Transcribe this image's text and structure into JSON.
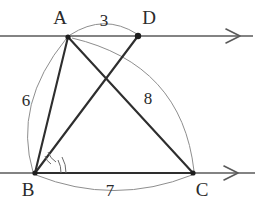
{
  "figure": {
    "background_color": "#ffffff",
    "line_color": "#5a5a5a",
    "segment_color": "#2e2e2e",
    "arc_color": "#8e8e8e",
    "label_color": "#2b2b2b"
  },
  "points": [
    {
      "id": "A",
      "label": "A",
      "x": 68,
      "y": 37,
      "label_x": 60,
      "label_y": 24,
      "dot": true
    },
    {
      "id": "D",
      "label": "D",
      "x": 138,
      "y": 36,
      "label_x": 149,
      "label_y": 24,
      "dot": true
    },
    {
      "id": "B",
      "label": "B",
      "x": 35,
      "y": 173,
      "label_x": 28,
      "label_y": 196,
      "dot": true
    },
    {
      "id": "C",
      "label": "C",
      "x": 193,
      "y": 173,
      "label_x": 202,
      "label_y": 196,
      "dot": true
    }
  ],
  "measure_labels": [
    {
      "id": "len-AD",
      "value": "3",
      "x": 104,
      "y": 26,
      "between": "A-D"
    },
    {
      "id": "len-AB",
      "value": "6",
      "x": 26,
      "y": 106,
      "between": "A-B"
    },
    {
      "id": "len-AC",
      "value": "8",
      "x": 148,
      "y": 104,
      "between": "A-C"
    },
    {
      "id": "len-BC",
      "value": "7",
      "x": 110,
      "y": 196,
      "between": "B-C"
    }
  ],
  "rays": [
    {
      "id": "ray-top",
      "x1": 0,
      "y1": 36,
      "x2": 253,
      "y2": 36,
      "arrow_at": 234
    },
    {
      "id": "ray-bottom",
      "x1": 0,
      "y1": 173,
      "x2": 255,
      "y2": 173,
      "arrow_at": 233
    }
  ],
  "segments": [
    {
      "id": "seg-AB",
      "from": "A",
      "to": "B"
    },
    {
      "id": "seg-AC",
      "from": "A",
      "to": "C"
    },
    {
      "id": "seg-BD",
      "from": "B",
      "to": "D"
    },
    {
      "id": "seg-BC",
      "from": "B",
      "to": "C"
    }
  ],
  "arcs": [
    {
      "id": "arc-AD",
      "d": "M 70 35 Q 104 13 137 34",
      "label": "3"
    },
    {
      "id": "arc-AB",
      "d": "M 66 39 Q 13 104 33 172",
      "label": "6"
    },
    {
      "id": "arc-AC",
      "d": "M 72 38 Q 182 64 194 171",
      "label": "8"
    },
    {
      "id": "arc-BC",
      "d": "M 36 175 Q 114 206 192 175",
      "label": "7"
    }
  ],
  "angle_marks": [
    {
      "id": "angle-ABD-inner",
      "d": "M 45 156 A 14 14 0 0 0 51 164"
    },
    {
      "id": "angle-ABD-outer",
      "d": "M 48 152 A 19 19 0 0 0 56 162"
    },
    {
      "id": "angle-DBC-1",
      "d": "M 58 160 A 26 26 0 0 1 61 173"
    },
    {
      "id": "angle-DBC-2",
      "d": "M 62 157 A 31 31 0 0 1 66 173"
    }
  ]
}
